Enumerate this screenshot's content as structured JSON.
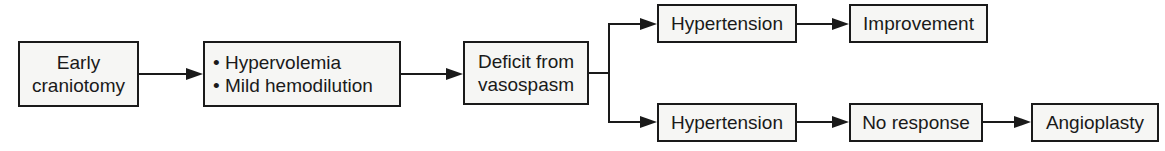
{
  "diagram": {
    "type": "flowchart",
    "nodes": {
      "early_craniotomy": {
        "lines": [
          "Early",
          "craniotomy"
        ]
      },
      "treatment": {
        "lines": [
          "• Hypervolemia",
          "• Mild hemodilution"
        ]
      },
      "deficit": {
        "lines": [
          "Deficit from",
          "vasospasm"
        ]
      },
      "hypertension_top": {
        "lines": [
          "Hypertension"
        ]
      },
      "improvement": {
        "lines": [
          "Improvement"
        ]
      },
      "hypertension_bottom": {
        "lines": [
          "Hypertension"
        ]
      },
      "no_response": {
        "lines": [
          "No response"
        ]
      },
      "angioplasty": {
        "lines": [
          "Angioplasty"
        ]
      }
    },
    "edges": [
      [
        "early_craniotomy",
        "treatment"
      ],
      [
        "treatment",
        "deficit"
      ],
      [
        "deficit",
        "hypertension_top"
      ],
      [
        "deficit",
        "hypertension_bottom"
      ],
      [
        "hypertension_top",
        "improvement"
      ],
      [
        "hypertension_bottom",
        "no_response"
      ],
      [
        "no_response",
        "angioplasty"
      ]
    ]
  }
}
